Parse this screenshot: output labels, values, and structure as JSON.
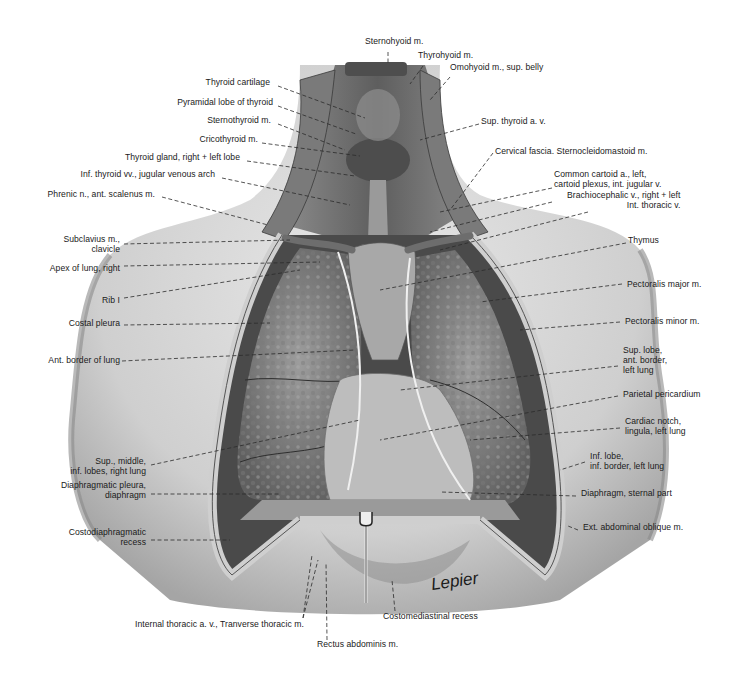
{
  "figure": {
    "signature": "Lepier",
    "colors": {
      "background": "#ffffff",
      "skin": "#dcdcdc",
      "skin_shadow": "#a9a9a9",
      "lung": "#8f8f8f",
      "lung_dark": "#5c5c5c",
      "muscle": "#6d6d6d",
      "text": "#1a1a1a",
      "leader": "#2b2b2b"
    }
  },
  "labels": {
    "top": [
      {
        "id": "sternohyoid",
        "lines": [
          "Sternohyoid m."
        ],
        "x": 365,
        "y": 41,
        "align": "left"
      },
      {
        "id": "thyrohyoid",
        "lines": [
          "Thyrohyoid m."
        ],
        "x": 418,
        "y": 55,
        "align": "left"
      },
      {
        "id": "omohyoid",
        "lines": [
          "Omohyoid m., sup. belly"
        ],
        "x": 450,
        "y": 67,
        "align": "left"
      }
    ],
    "left": [
      {
        "id": "thyroid-cartilage",
        "lines": [
          "Thyroid cartilage"
        ],
        "x": 270,
        "y": 82
      },
      {
        "id": "pyramidal-lobe",
        "lines": [
          "Pyramidal lobe of thyroid"
        ],
        "x": 273,
        "y": 102
      },
      {
        "id": "sternothyroid",
        "lines": [
          "Sternothyroid m."
        ],
        "x": 271,
        "y": 120
      },
      {
        "id": "cricothyroid",
        "lines": [
          "Cricothyroid m."
        ],
        "x": 258,
        "y": 139
      },
      {
        "id": "thyroid-gland",
        "lines": [
          "Thyroid gland, right + left lobe"
        ],
        "x": 240,
        "y": 157
      },
      {
        "id": "inf-thyroid-vv",
        "lines": [
          "Inf. thyroid vv., jugular venous arch"
        ],
        "x": 215,
        "y": 174
      },
      {
        "id": "phrenic-n",
        "lines": [
          "Phrenic n., ant. scalenus m."
        ],
        "x": 155,
        "y": 194
      },
      {
        "id": "subclavius",
        "lines": [
          "Subclavius m.,",
          "clavicle"
        ],
        "x": 120,
        "y": 239
      },
      {
        "id": "apex-lung",
        "lines": [
          "Apex of lung, right"
        ],
        "x": 120,
        "y": 268
      },
      {
        "id": "rib-1",
        "lines": [
          "Rib I"
        ],
        "x": 120,
        "y": 300
      },
      {
        "id": "costal-pleura",
        "lines": [
          "Costal pleura"
        ],
        "x": 120,
        "y": 323
      },
      {
        "id": "ant-border-lung",
        "lines": [
          "Ant. border of lung"
        ],
        "x": 120,
        "y": 360
      },
      {
        "id": "right-lung-lobes",
        "lines": [
          "Sup., middle,",
          "inf. lobes, right lung"
        ],
        "x": 146,
        "y": 461
      },
      {
        "id": "diaphragmatic-pleura",
        "lines": [
          "Diaphragmatic pleura,",
          "diaphragm"
        ],
        "x": 146,
        "y": 485
      },
      {
        "id": "costodiaphragmatic",
        "lines": [
          "Costodiaphragmatic",
          "recess"
        ],
        "x": 146,
        "y": 532
      }
    ],
    "right": [
      {
        "id": "sup-thyroid",
        "lines": [
          "Sup. thyroid a. v."
        ],
        "x": 481,
        "y": 121
      },
      {
        "id": "cervical-fascia",
        "lines": [
          "Cervical fascia. Sternocleidomastoid m."
        ],
        "x": 495,
        "y": 151
      },
      {
        "id": "common-carotid",
        "lines": [
          "Common cartoid a., left,",
          "cartoid plexus, int. jugular v."
        ],
        "x": 554,
        "y": 174
      },
      {
        "id": "brachiocephalic",
        "lines": [
          "Brachiocephalic v., right + left",
          "Int. thoracic v."
        ],
        "x": 567,
        "y": 195,
        "align": "right-block"
      },
      {
        "id": "thymus",
        "lines": [
          "Thymus"
        ],
        "x": 628,
        "y": 240
      },
      {
        "id": "pectoralis-major",
        "lines": [
          "Pectoralis major m."
        ],
        "x": 627,
        "y": 284
      },
      {
        "id": "pectoralis-minor",
        "lines": [
          "Pectoralis minor m."
        ],
        "x": 625,
        "y": 321
      },
      {
        "id": "sup-lobe-left",
        "lines": [
          "Sup. lobe,",
          "ant. border,",
          "left lung"
        ],
        "x": 623,
        "y": 350
      },
      {
        "id": "parietal-pericardium",
        "lines": [
          "Parietal pericardium"
        ],
        "x": 623,
        "y": 394
      },
      {
        "id": "cardiac-notch",
        "lines": [
          "Cardiac notch,",
          "lingula, left lung"
        ],
        "x": 625,
        "y": 421
      },
      {
        "id": "inf-lobe-left",
        "lines": [
          "Inf. lobe,",
          "inf. border, left lung"
        ],
        "x": 590,
        "y": 456
      },
      {
        "id": "diaphragm-sternal",
        "lines": [
          "Diaphragm, sternal part"
        ],
        "x": 581,
        "y": 493
      },
      {
        "id": "ext-abdominal-oblique",
        "lines": [
          "Ext. abdominal oblique m."
        ],
        "x": 583,
        "y": 527
      }
    ],
    "bottom": [
      {
        "id": "internal-thoracic",
        "lines": [
          "Internal thoracic a. v., Tranverse thoracic m."
        ],
        "x": 135,
        "y": 624
      },
      {
        "id": "costomediastinal",
        "lines": [
          "Costomediastinal recess"
        ],
        "x": 383,
        "y": 616
      },
      {
        "id": "rectus-abdominis",
        "lines": [
          "Rectus abdominis m."
        ],
        "x": 317,
        "y": 644
      }
    ]
  },
  "leaders": [
    {
      "for": "sternohyoid",
      "x1": 388,
      "y1": 52,
      "x2": 388,
      "y2": 64
    },
    {
      "for": "thyrohyoid",
      "x1": 423,
      "y1": 66,
      "x2": 410,
      "y2": 84
    },
    {
      "for": "omohyoid",
      "x1": 450,
      "y1": 77,
      "x2": 430,
      "y2": 100
    },
    {
      "for": "thyroid-cartilage",
      "x1": 278,
      "y1": 86,
      "x2": 365,
      "y2": 118
    },
    {
      "for": "pyramidal-lobe",
      "x1": 278,
      "y1": 106,
      "x2": 356,
      "y2": 134
    },
    {
      "for": "sternothyroid",
      "x1": 278,
      "y1": 124,
      "x2": 345,
      "y2": 150
    },
    {
      "for": "cricothyroid",
      "x1": 262,
      "y1": 143,
      "x2": 360,
      "y2": 156
    },
    {
      "for": "thyroid-gland",
      "x1": 247,
      "y1": 161,
      "x2": 355,
      "y2": 176
    },
    {
      "for": "inf-thyroid-vv",
      "x1": 222,
      "y1": 178,
      "x2": 350,
      "y2": 205
    },
    {
      "for": "phrenic-n",
      "x1": 162,
      "y1": 197,
      "x2": 268,
      "y2": 225
    },
    {
      "for": "subclavius",
      "x1": 124,
      "y1": 244,
      "x2": 290,
      "y2": 240
    },
    {
      "for": "apex-lung",
      "x1": 124,
      "y1": 266,
      "x2": 320,
      "y2": 262
    },
    {
      "for": "rib-1",
      "x1": 124,
      "y1": 298,
      "x2": 300,
      "y2": 270
    },
    {
      "for": "costal-pleura",
      "x1": 124,
      "y1": 325,
      "x2": 270,
      "y2": 323
    },
    {
      "for": "ant-border-lung",
      "x1": 122,
      "y1": 361,
      "x2": 355,
      "y2": 350
    },
    {
      "for": "right-lung-lobes",
      "x1": 151,
      "y1": 465,
      "x2": 360,
      "y2": 420
    },
    {
      "for": "diaphragmatic-pleura",
      "x1": 151,
      "y1": 494,
      "x2": 280,
      "y2": 494
    },
    {
      "for": "costodiaphragmatic",
      "x1": 151,
      "y1": 540,
      "x2": 230,
      "y2": 540
    },
    {
      "for": "sup-thyroid",
      "x1": 479,
      "y1": 124,
      "x2": 420,
      "y2": 140
    },
    {
      "for": "cervical-fascia",
      "x1": 493,
      "y1": 153,
      "x2": 450,
      "y2": 210
    },
    {
      "for": "common-carotid",
      "x1": 552,
      "y1": 188,
      "x2": 440,
      "y2": 212
    },
    {
      "for": "brachiocephalic",
      "x1": 552,
      "y1": 202,
      "x2": 430,
      "y2": 232
    },
    {
      "for": "brachiocephalic-2",
      "x1": 588,
      "y1": 212,
      "x2": 440,
      "y2": 250
    },
    {
      "for": "thymus",
      "x1": 626,
      "y1": 243,
      "x2": 380,
      "y2": 290
    },
    {
      "for": "pectoralis-major",
      "x1": 622,
      "y1": 284,
      "x2": 480,
      "y2": 302
    },
    {
      "for": "pectoralis-minor",
      "x1": 620,
      "y1": 322,
      "x2": 520,
      "y2": 330
    },
    {
      "for": "sup-lobe-left",
      "x1": 618,
      "y1": 366,
      "x2": 400,
      "y2": 390
    },
    {
      "for": "parietal-pericardium",
      "x1": 618,
      "y1": 396,
      "x2": 380,
      "y2": 440
    },
    {
      "for": "cardiac-notch",
      "x1": 620,
      "y1": 428,
      "x2": 470,
      "y2": 440
    },
    {
      "for": "inf-lobe-left",
      "x1": 585,
      "y1": 462,
      "x2": 560,
      "y2": 470
    },
    {
      "for": "diaphragm-sternal",
      "x1": 576,
      "y1": 496,
      "x2": 440,
      "y2": 492
    },
    {
      "for": "ext-abdominal-oblique",
      "x1": 578,
      "y1": 530,
      "x2": 568,
      "y2": 526
    },
    {
      "for": "internal-thoracic",
      "x1": 303,
      "y1": 618,
      "x2": 312,
      "y2": 555
    },
    {
      "for": "internal-thoracic-2",
      "x1": 303,
      "y1": 618,
      "x2": 318,
      "y2": 560
    },
    {
      "for": "rectus-abdominis",
      "x1": 327,
      "y1": 640,
      "x2": 326,
      "y2": 562
    },
    {
      "for": "costomediastinal",
      "x1": 395,
      "y1": 611,
      "x2": 392,
      "y2": 580
    }
  ]
}
